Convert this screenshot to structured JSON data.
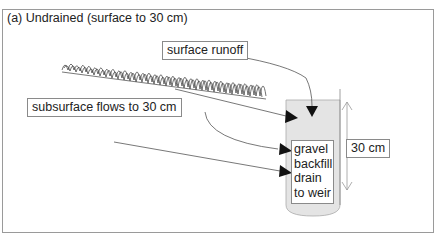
{
  "diagram": {
    "title": "(a) Undrained (surface to 30 cm)",
    "labels": {
      "surface_runoff": "surface runoff",
      "subsurface_flows": "subsurface flows to 30 cm",
      "depth": "30 cm"
    },
    "drain_lines": [
      "gravel",
      "backfill",
      "drain",
      "to weir"
    ],
    "colors": {
      "frame": "#9a9a9a",
      "drain_fill": "#e4e4e4",
      "arrow": "#111111",
      "line": "#555555"
    }
  }
}
